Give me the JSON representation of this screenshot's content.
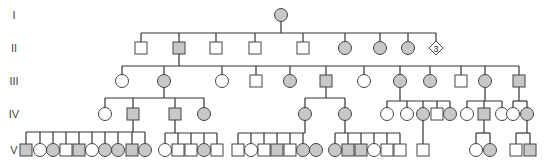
{
  "colors": {
    "affected": "#c8c8c8",
    "unaffected": "#ffffff",
    "stroke": "#444444",
    "line": "#333333"
  },
  "generations": [
    {
      "label": "I",
      "y": 15
    },
    {
      "label": "II",
      "y": 48
    },
    {
      "label": "III",
      "y": 81
    },
    {
      "label": "IV",
      "y": 114
    },
    {
      "label": "V",
      "y": 150
    }
  ],
  "individuals": [
    {
      "id": "I-1",
      "gen": 0,
      "x": 281,
      "sex": "F",
      "affected": true
    },
    {
      "id": "II-1",
      "gen": 1,
      "x": 141,
      "sex": "M",
      "affected": false
    },
    {
      "id": "II-2",
      "gen": 1,
      "x": 179,
      "sex": "M",
      "affected": true
    },
    {
      "id": "II-3",
      "gen": 1,
      "x": 216,
      "sex": "M",
      "affected": false
    },
    {
      "id": "II-4",
      "gen": 1,
      "x": 255,
      "sex": "M",
      "affected": false
    },
    {
      "id": "II-5",
      "gen": 1,
      "x": 303,
      "sex": "M",
      "affected": false
    },
    {
      "id": "II-6",
      "gen": 1,
      "x": 345,
      "sex": "F",
      "affected": true
    },
    {
      "id": "II-7",
      "gen": 1,
      "x": 380,
      "sex": "F",
      "affected": true
    },
    {
      "id": "II-8",
      "gen": 1,
      "x": 408,
      "sex": "F",
      "affected": true
    },
    {
      "id": "II-9",
      "gen": 1,
      "x": 436,
      "sex": "U",
      "affected": false,
      "count": "3"
    },
    {
      "id": "III-1",
      "gen": 2,
      "x": 122,
      "sex": "F",
      "affected": false
    },
    {
      "id": "III-2",
      "gen": 2,
      "x": 164,
      "sex": "F",
      "affected": true
    },
    {
      "id": "III-3",
      "gen": 2,
      "x": 222,
      "sex": "F",
      "affected": false
    },
    {
      "id": "III-4",
      "gen": 2,
      "x": 256,
      "sex": "M",
      "affected": false
    },
    {
      "id": "III-5",
      "gen": 2,
      "x": 290,
      "sex": "F",
      "affected": true
    },
    {
      "id": "III-6",
      "gen": 2,
      "x": 326,
      "sex": "M",
      "affected": true
    },
    {
      "id": "III-7",
      "gen": 2,
      "x": 364,
      "sex": "F",
      "affected": false
    },
    {
      "id": "III-8",
      "gen": 2,
      "x": 400,
      "sex": "F",
      "affected": true
    },
    {
      "id": "III-9",
      "gen": 2,
      "x": 430,
      "sex": "F",
      "affected": true
    },
    {
      "id": "III-10",
      "gen": 2,
      "x": 461,
      "sex": "M",
      "affected": false
    },
    {
      "id": "III-11",
      "gen": 2,
      "x": 485,
      "sex": "F",
      "affected": true
    },
    {
      "id": "III-12",
      "gen": 2,
      "x": 519,
      "sex": "M",
      "affected": true
    },
    {
      "id": "IV-1",
      "gen": 3,
      "x": 105,
      "sex": "F",
      "affected": false
    },
    {
      "id": "IV-2",
      "gen": 3,
      "x": 133,
      "sex": "M",
      "affected": true
    },
    {
      "id": "IV-3",
      "gen": 3,
      "x": 175,
      "sex": "M",
      "affected": true
    },
    {
      "id": "IV-4",
      "gen": 3,
      "x": 204,
      "sex": "F",
      "affected": true
    },
    {
      "id": "IV-5",
      "gen": 3,
      "x": 305,
      "sex": "F",
      "affected": true
    },
    {
      "id": "IV-6",
      "gen": 3,
      "x": 345,
      "sex": "F",
      "affected": true
    },
    {
      "id": "IV-7",
      "gen": 3,
      "x": 387,
      "sex": "F",
      "affected": false
    },
    {
      "id": "IV-8",
      "gen": 3,
      "x": 407,
      "sex": "F",
      "affected": false
    },
    {
      "id": "IV-9",
      "gen": 3,
      "x": 423,
      "sex": "F",
      "affected": true
    },
    {
      "id": "IV-10",
      "gen": 3,
      "x": 437,
      "sex": "M",
      "affected": false
    },
    {
      "id": "IV-11",
      "gen": 3,
      "x": 450,
      "sex": "F",
      "affected": true
    },
    {
      "id": "IV-12",
      "gen": 3,
      "x": 467,
      "sex": "F",
      "affected": false
    },
    {
      "id": "IV-13",
      "gen": 3,
      "x": 484,
      "sex": "M",
      "affected": true
    },
    {
      "id": "IV-14",
      "gen": 3,
      "x": 502,
      "sex": "F",
      "affected": false
    },
    {
      "id": "IV-15",
      "gen": 3,
      "x": 513,
      "sex": "F",
      "affected": false
    },
    {
      "id": "IV-16",
      "gen": 3,
      "x": 527,
      "sex": "F",
      "affected": true
    },
    {
      "id": "V-1",
      "gen": 4,
      "x": 26,
      "sex": "M",
      "affected": true
    },
    {
      "id": "V-2",
      "gen": 4,
      "x": 40,
      "sex": "F",
      "affected": false
    },
    {
      "id": "V-3",
      "gen": 4,
      "x": 53,
      "sex": "F",
      "affected": true
    },
    {
      "id": "V-4",
      "gen": 4,
      "x": 66,
      "sex": "M",
      "affected": false
    },
    {
      "id": "V-5",
      "gen": 4,
      "x": 79,
      "sex": "M",
      "affected": true
    },
    {
      "id": "V-6",
      "gen": 4,
      "x": 92,
      "sex": "F",
      "affected": false
    },
    {
      "id": "V-7",
      "gen": 4,
      "x": 105,
      "sex": "F",
      "affected": true
    },
    {
      "id": "V-8",
      "gen": 4,
      "x": 118,
      "sex": "F",
      "affected": true
    },
    {
      "id": "V-9",
      "gen": 4,
      "x": 132,
      "sex": "M",
      "affected": true
    },
    {
      "id": "V-10",
      "gen": 4,
      "x": 145,
      "sex": "F",
      "affected": true
    },
    {
      "id": "V-11",
      "gen": 4,
      "x": 165,
      "sex": "F",
      "affected": false
    },
    {
      "id": "V-12",
      "gen": 4,
      "x": 178,
      "sex": "M",
      "affected": false
    },
    {
      "id": "V-13",
      "gen": 4,
      "x": 191,
      "sex": "M",
      "affected": false
    },
    {
      "id": "V-14",
      "gen": 4,
      "x": 204,
      "sex": "F",
      "affected": true
    },
    {
      "id": "V-15",
      "gen": 4,
      "x": 217,
      "sex": "M",
      "affected": false
    },
    {
      "id": "V-16",
      "gen": 4,
      "x": 238,
      "sex": "M",
      "affected": false
    },
    {
      "id": "V-17",
      "gen": 4,
      "x": 251,
      "sex": "F",
      "affected": false
    },
    {
      "id": "V-18",
      "gen": 4,
      "x": 264,
      "sex": "M",
      "affected": false
    },
    {
      "id": "V-19",
      "gen": 4,
      "x": 277,
      "sex": "M",
      "affected": true
    },
    {
      "id": "V-20",
      "gen": 4,
      "x": 290,
      "sex": "M",
      "affected": false
    },
    {
      "id": "V-21",
      "gen": 4,
      "x": 303,
      "sex": "F",
      "affected": true
    },
    {
      "id": "V-22",
      "gen": 4,
      "x": 316,
      "sex": "F",
      "affected": true
    },
    {
      "id": "V-23",
      "gen": 4,
      "x": 335,
      "sex": "F",
      "affected": true
    },
    {
      "id": "V-24",
      "gen": 4,
      "x": 348,
      "sex": "M",
      "affected": true
    },
    {
      "id": "V-25",
      "gen": 4,
      "x": 361,
      "sex": "M",
      "affected": true
    },
    {
      "id": "V-26",
      "gen": 4,
      "x": 374,
      "sex": "F",
      "affected": false
    },
    {
      "id": "V-27",
      "gen": 4,
      "x": 387,
      "sex": "M",
      "affected": false
    },
    {
      "id": "V-28",
      "gen": 4,
      "x": 400,
      "sex": "M",
      "affected": false
    },
    {
      "id": "V-29",
      "gen": 4,
      "x": 423,
      "sex": "M",
      "affected": false
    },
    {
      "id": "V-30",
      "gen": 4,
      "x": 476,
      "sex": "F",
      "affected": false
    },
    {
      "id": "V-31",
      "gen": 4,
      "x": 490,
      "sex": "F",
      "affected": true
    },
    {
      "id": "V-32",
      "gen": 4,
      "x": 516,
      "sex": "M",
      "affected": false
    },
    {
      "id": "V-33",
      "gen": 4,
      "x": 530,
      "sex": "M",
      "affected": true
    }
  ],
  "sibships": [
    {
      "parent_x": 281,
      "parent_gen": 0,
      "bar_y": 33,
      "children": [
        141,
        179,
        216,
        255,
        303,
        345,
        380,
        408,
        436
      ]
    },
    {
      "parent_x": 179,
      "parent_gen": 1,
      "bar_y": 66,
      "children": [
        122,
        164,
        222,
        256,
        290,
        326,
        364,
        400,
        430,
        461,
        485,
        519
      ]
    },
    {
      "parent_x": 164,
      "parent_gen": 2,
      "bar_y": 98,
      "children": [
        105,
        133,
        175,
        204
      ]
    },
    {
      "parent_x": 326,
      "parent_gen": 2,
      "bar_y": 98,
      "children": [
        305,
        345
      ]
    },
    {
      "parent_x": 400,
      "parent_gen": 2,
      "bar_y": 101,
      "children": [
        387,
        407,
        423,
        437,
        450
      ]
    },
    {
      "parent_x": 485,
      "parent_gen": 2,
      "bar_y": 101,
      "children": [
        467,
        484,
        502
      ]
    },
    {
      "parent_x": 519,
      "parent_gen": 2,
      "bar_y": 101,
      "children": [
        513,
        527
      ]
    },
    {
      "parent_x": 133,
      "parent_gen": 3,
      "bar_y": 132,
      "children": [
        26,
        40,
        53,
        66,
        79,
        92,
        105,
        118,
        132,
        145
      ]
    },
    {
      "parent_x": 175,
      "parent_gen": 3,
      "bar_y": 133,
      "children": [
        165,
        178,
        191,
        204,
        217
      ]
    },
    {
      "parent_x": 305,
      "parent_gen": 3,
      "bar_y": 133,
      "children": [
        238,
        251,
        264,
        277,
        290,
        303
      ]
    },
    {
      "parent_x": 345,
      "parent_gen": 3,
      "bar_y": 133,
      "children": [
        335,
        348,
        361,
        374,
        387,
        400
      ]
    },
    {
      "parent_x": 423,
      "parent_gen": 3,
      "bar_y": null,
      "children": [
        423
      ]
    },
    {
      "parent_x": 484,
      "parent_gen": 3,
      "bar_y": 133,
      "children": [
        476,
        490
      ]
    },
    {
      "parent_x": 527,
      "parent_gen": 3,
      "bar_y": 133,
      "children": [
        516,
        530
      ]
    }
  ]
}
